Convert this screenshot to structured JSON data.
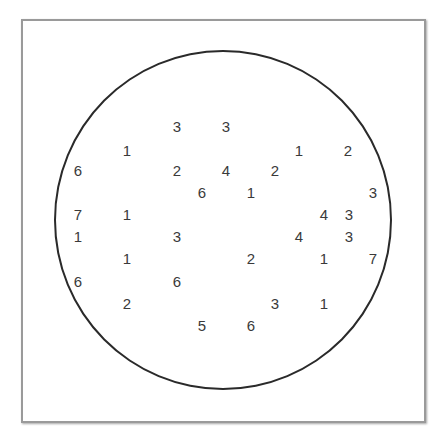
{
  "diagram": {
    "type": "numbers-in-circle",
    "frame": {
      "border_color": "#9a9a9a"
    },
    "circle": {
      "stroke_color": "#2a2a2a"
    },
    "text_color": "#3a3a3a",
    "numbers": [
      {
        "value": "3",
        "x": 177,
        "y": 126
      },
      {
        "value": "3",
        "x": 226,
        "y": 126
      },
      {
        "value": "1",
        "x": 127,
        "y": 150
      },
      {
        "value": "1",
        "x": 299,
        "y": 150
      },
      {
        "value": "2",
        "x": 348,
        "y": 150
      },
      {
        "value": "6",
        "x": 78,
        "y": 170
      },
      {
        "value": "2",
        "x": 177,
        "y": 170
      },
      {
        "value": "4",
        "x": 226,
        "y": 170
      },
      {
        "value": "2",
        "x": 275,
        "y": 170
      },
      {
        "value": "6",
        "x": 202,
        "y": 192
      },
      {
        "value": "1",
        "x": 251,
        "y": 192
      },
      {
        "value": "3",
        "x": 373,
        "y": 192
      },
      {
        "value": "7",
        "x": 78,
        "y": 214
      },
      {
        "value": "1",
        "x": 127,
        "y": 214
      },
      {
        "value": "4",
        "x": 324,
        "y": 214
      },
      {
        "value": "3",
        "x": 349,
        "y": 214
      },
      {
        "value": "1",
        "x": 78,
        "y": 236
      },
      {
        "value": "3",
        "x": 177,
        "y": 236
      },
      {
        "value": "4",
        "x": 299,
        "y": 236
      },
      {
        "value": "3",
        "x": 349,
        "y": 236
      },
      {
        "value": "1",
        "x": 127,
        "y": 258
      },
      {
        "value": "2",
        "x": 251,
        "y": 258
      },
      {
        "value": "1",
        "x": 324,
        "y": 258
      },
      {
        "value": "7",
        "x": 373,
        "y": 258
      },
      {
        "value": "6",
        "x": 78,
        "y": 281
      },
      {
        "value": "6",
        "x": 177,
        "y": 281
      },
      {
        "value": "2",
        "x": 127,
        "y": 303
      },
      {
        "value": "3",
        "x": 275,
        "y": 303
      },
      {
        "value": "1",
        "x": 324,
        "y": 303
      },
      {
        "value": "5",
        "x": 202,
        "y": 325
      },
      {
        "value": "6",
        "x": 251,
        "y": 325
      }
    ]
  }
}
